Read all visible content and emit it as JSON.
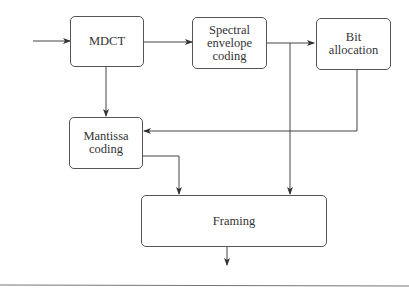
{
  "diagram": {
    "blocks": {
      "mdct": {
        "label": "MDCT"
      },
      "spectral": {
        "label": "Spectral\nenvelope\ncoding"
      },
      "bit": {
        "label": "Bit\nallocation"
      },
      "mantissa": {
        "label": "Mantissa\ncoding"
      },
      "framing": {
        "label": "Framing"
      }
    },
    "colors": {
      "line": "#444444",
      "border": "#555555",
      "text": "#333333"
    }
  }
}
